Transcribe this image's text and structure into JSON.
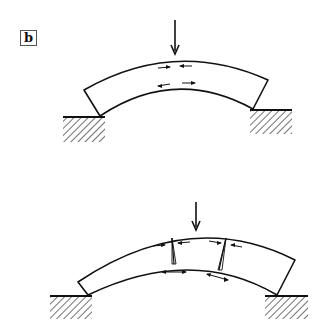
{
  "figure": {
    "panel_label": "b",
    "diagrams": [
      {
        "name": "intact-arch",
        "description": "Curved beam under central point load resting on two supports; compression arrows at top, tension arrows at bottom",
        "load_arrow": "down",
        "top_arrows": [
          "right",
          "left"
        ],
        "bottom_arrows": [
          "left",
          "right"
        ]
      },
      {
        "name": "cracked-arch",
        "description": "Curved beam under central point load with two cracks; compression at top across cracks, tension at bottom",
        "load_arrow": "down",
        "cracks": 2,
        "top_arrows": [
          "right",
          "left",
          "right",
          "left"
        ],
        "bottom_arrows": [
          "double",
          "double"
        ]
      }
    ],
    "colors": {
      "ink": "#111111",
      "background": "#ffffff"
    }
  }
}
